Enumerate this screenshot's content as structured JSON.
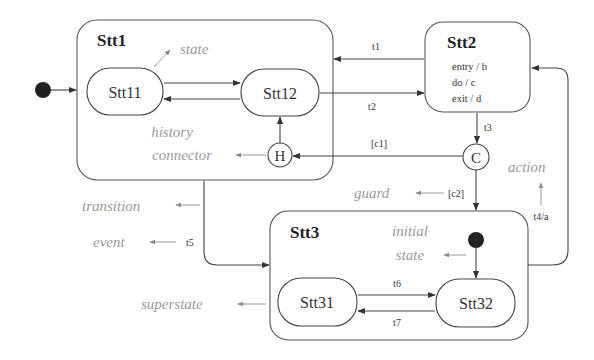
{
  "diagram": {
    "type": "uml-statechart",
    "states": {
      "stt1": {
        "label": "Stt1"
      },
      "stt11": {
        "label": "Stt11"
      },
      "stt12": {
        "label": "Stt12"
      },
      "stt2": {
        "label": "Stt2",
        "actions": [
          "entry / b",
          "do / c",
          "exit / d"
        ]
      },
      "stt3": {
        "label": "Stt3"
      },
      "stt31": {
        "label": "Stt31"
      },
      "stt32": {
        "label": "Stt32"
      }
    },
    "connectors": {
      "history": {
        "label": "H"
      },
      "condition": {
        "label": "C"
      }
    },
    "transitions": {
      "t1": "t1",
      "t2": "t2",
      "t3": "t3",
      "t4a": "t4/a",
      "t5": "t5",
      "t6": "t6",
      "t7": "t7",
      "c1": "[c1]",
      "c2": "[c2]"
    },
    "annotations": {
      "state": "state",
      "history_line1": "history",
      "history_line2": "connector",
      "transition": "transition",
      "event": "event",
      "guard": "guard",
      "action": "action",
      "initial_line1": "initial",
      "initial_line2": "state",
      "superstate": "superstate"
    },
    "colors": {
      "line": "#444444",
      "annotation": "#9a9a9a",
      "initial_dot": "#222222"
    }
  }
}
